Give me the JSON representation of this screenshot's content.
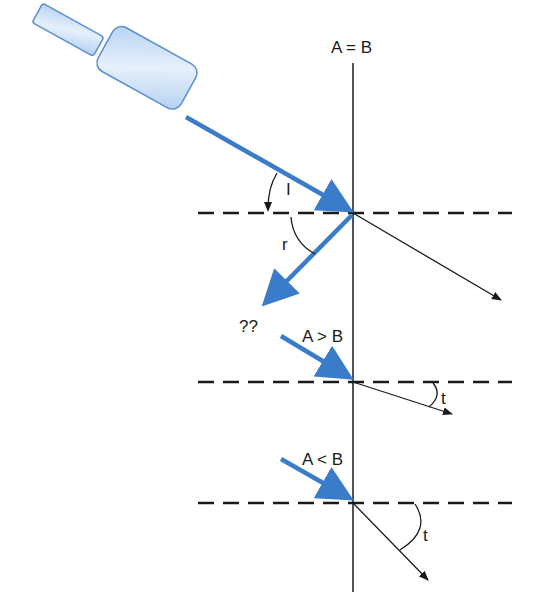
{
  "labels": {
    "interface_top": "A = B",
    "incidence_angle": "I",
    "reflection_angle": "r",
    "unknown": "??",
    "case_greater": "A > B",
    "transmit_angle_1": "t",
    "case_less": "A < B",
    "transmit_angle_2": "t"
  },
  "colors": {
    "beam": "#3a7cc9",
    "transducer_fill": "#c9def5",
    "transducer_stroke": "#5a8fd0",
    "line": "#1a1a1a"
  }
}
